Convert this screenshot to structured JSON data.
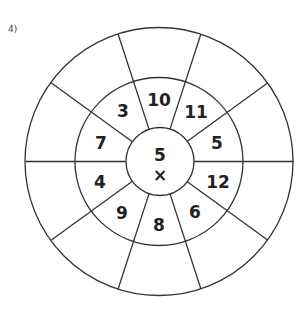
{
  "problem": {
    "number_label": "4)"
  },
  "wheel": {
    "center": {
      "number": "5",
      "operator": "×"
    },
    "inner_ring": [
      {
        "value": "10",
        "x": 159,
        "y": 100
      },
      {
        "value": "11",
        "x": 196,
        "y": 112
      },
      {
        "value": "5",
        "x": 217,
        "y": 143
      },
      {
        "value": "12",
        "x": 218,
        "y": 182
      },
      {
        "value": "6",
        "x": 195,
        "y": 212
      },
      {
        "value": "8",
        "x": 159,
        "y": 225
      },
      {
        "value": "9",
        "x": 122,
        "y": 213
      },
      {
        "value": "4",
        "x": 100,
        "y": 182
      },
      {
        "value": "7",
        "x": 101,
        "y": 143
      },
      {
        "value": "3",
        "x": 123,
        "y": 111
      }
    ],
    "outer_ring": [
      "",
      "",
      "",
      "",
      "",
      "",
      "",
      "",
      "",
      ""
    ],
    "line_color": "#333333",
    "text_color": "#222222"
  }
}
